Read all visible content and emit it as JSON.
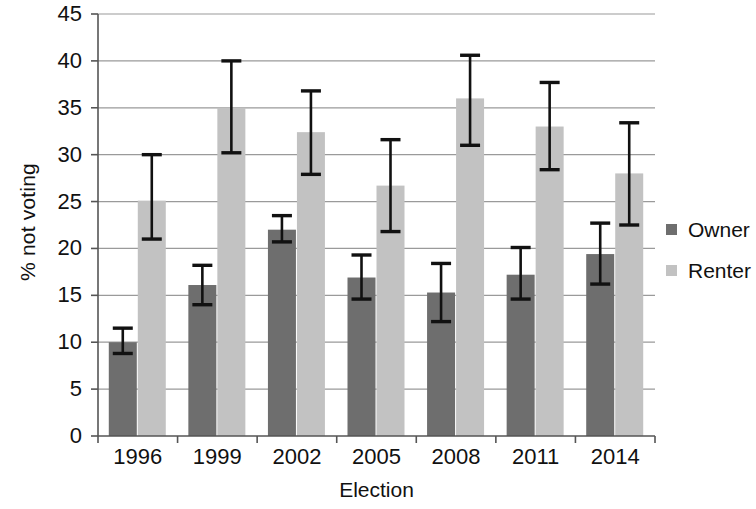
{
  "chart_data": {
    "type": "bar",
    "title": "",
    "xlabel": "Election",
    "ylabel": "% not voting",
    "categories": [
      "1996",
      "1999",
      "2002",
      "2005",
      "2008",
      "2011",
      "2014"
    ],
    "ylim": [
      0,
      45
    ],
    "ytick_values": [
      0,
      5,
      10,
      15,
      20,
      25,
      30,
      35,
      40,
      45
    ],
    "ytick_labels": [
      "0",
      "5",
      "10",
      "15",
      "20",
      "25",
      "30",
      "35",
      "40",
      "45"
    ],
    "grid": true,
    "grid_axis": "y",
    "legend_position": "right",
    "error_bars": true,
    "series": [
      {
        "name": "Owner",
        "color": "#6e6e6e",
        "values": [
          10.0,
          16.1,
          22.0,
          16.9,
          15.3,
          17.2,
          19.4
        ],
        "err_low": [
          8.8,
          14.0,
          20.7,
          14.6,
          12.2,
          14.6,
          16.2
        ],
        "err_high": [
          11.5,
          18.2,
          23.5,
          19.3,
          18.4,
          20.1,
          22.7
        ]
      },
      {
        "name": "Renter",
        "color": "#c2c2c2",
        "values": [
          25.1,
          35.0,
          32.4,
          26.7,
          36.0,
          33.0,
          28.0
        ],
        "err_low": [
          21.0,
          30.2,
          27.9,
          21.8,
          31.0,
          28.4,
          22.5
        ],
        "err_high": [
          30.0,
          40.0,
          36.8,
          31.6,
          40.6,
          37.7,
          33.4
        ]
      }
    ]
  },
  "axes": {
    "x_label": "Election",
    "y_label": "% not voting"
  },
  "legend": {
    "items": [
      {
        "label": "Owner",
        "color": "#6e6e6e"
      },
      {
        "label": "Renter",
        "color": "#c2c2c2"
      }
    ]
  },
  "colors": {
    "owner": "#6e6e6e",
    "renter": "#c2c2c2",
    "axis": "#555555",
    "grid": "#9a9a9a",
    "error": "#111111",
    "background": "#ffffff"
  }
}
